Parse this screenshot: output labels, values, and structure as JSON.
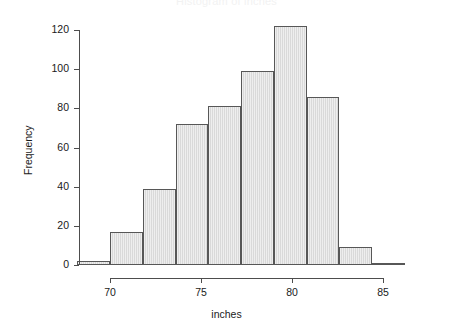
{
  "chart_data": {
    "type": "bar",
    "title": "Histogram of inches",
    "xlabel": "inches",
    "ylabel": "Frequency",
    "grid": false,
    "legend": "none",
    "xlim": [
      68.2,
      87.4
    ],
    "ylim": [
      0,
      125
    ],
    "bin_width": 1.8,
    "bin_edges": [
      68.2,
      70.0,
      71.8,
      73.6,
      75.4,
      77.2,
      79.0,
      80.8,
      82.6,
      84.4,
      86.2
    ],
    "categories": [
      "68.2-70.0",
      "70.0-71.8",
      "71.8-73.6",
      "73.6-75.4",
      "75.4-77.2",
      "77.2-79.0",
      "79.0-80.8",
      "80.8-82.6",
      "82.6-84.4",
      "84.4-86.2"
    ],
    "values": [
      2,
      17,
      39,
      72,
      81,
      99,
      122,
      86,
      9,
      1
    ],
    "x_ticks": [
      70,
      75,
      80,
      85
    ],
    "x_tick_labels": [
      "70",
      "75",
      "80",
      "85"
    ],
    "y_ticks": [
      0,
      20,
      40,
      60,
      80,
      100,
      120
    ],
    "y_tick_labels": [
      "0",
      "20",
      "40",
      "60",
      "80",
      "100",
      "120"
    ],
    "bar_fill_color": "#d9d9d9",
    "bar_edge_color": "#575757",
    "axis_color": "#4d4d4d",
    "text_color": "#1a1a1a",
    "background_color": "#ffffff"
  }
}
